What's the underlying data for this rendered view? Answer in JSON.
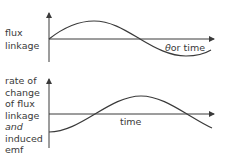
{
  "top_graph": {
    "y_label": [
      "flux",
      "linkage"
    ],
    "x_label_symbol": "θ",
    "x_label_text": "or time",
    "curve": "sine"
  },
  "bottom_graph": {
    "y_label": [
      "rate of",
      "change",
      "of flux",
      "linkage",
      "and",
      "induced",
      "emf"
    ],
    "x_label": "time",
    "curve": "negative cosine"
  },
  "colors": {
    "line": "#3a3a3a",
    "background": "#ffffff"
  }
}
